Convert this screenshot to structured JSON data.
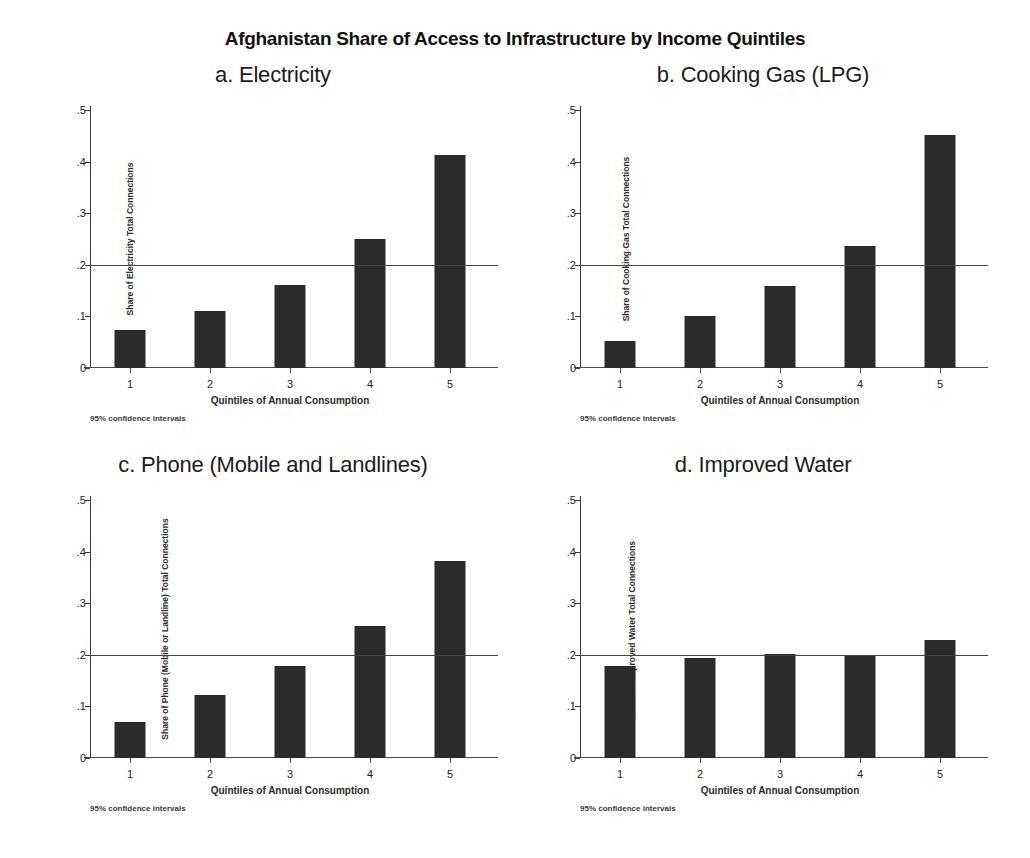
{
  "figure": {
    "title": "Afghanistan Share of Access to Infrastructure by Income Quintiles"
  },
  "chart_data": [
    {
      "type": "bar",
      "panel": "a",
      "title": "a. Electricity",
      "categories": [
        "1",
        "2",
        "3",
        "4",
        "5"
      ],
      "values": [
        0.073,
        0.11,
        0.16,
        0.25,
        0.412
      ],
      "xlabel": "Quintiles of Annual Consumption",
      "ylabel": "Share of Electricity Total Connections",
      "ylim": [
        0,
        0.5
      ],
      "yticks": [
        "0",
        ".1",
        ".2",
        ".3",
        ".4",
        ".5"
      ],
      "ytickvals": [
        0,
        0.1,
        0.2,
        0.3,
        0.4,
        0.5
      ],
      "reference_line": 0.2,
      "grid": false,
      "legend": "none",
      "note": "95% confidence intervals"
    },
    {
      "type": "bar",
      "panel": "b",
      "title": "b. Cooking Gas (LPG)",
      "categories": [
        "1",
        "2",
        "3",
        "4",
        "5"
      ],
      "values": [
        0.052,
        0.1,
        0.158,
        0.237,
        0.452
      ],
      "xlabel": "Quintiles of Annual Consumption",
      "ylabel": "Share of Cooking Gas Total Connections",
      "ylim": [
        0,
        0.5
      ],
      "yticks": [
        "0",
        ".1",
        ".2",
        ".3",
        ".4",
        ".5"
      ],
      "ytickvals": [
        0,
        0.1,
        0.2,
        0.3,
        0.4,
        0.5
      ],
      "reference_line": 0.2,
      "grid": false,
      "legend": "none",
      "note": "95% confidence intervals"
    },
    {
      "type": "bar",
      "panel": "c",
      "title": "c. Phone (Mobile and Landlines)",
      "categories": [
        "1",
        "2",
        "3",
        "4",
        "5"
      ],
      "values": [
        0.069,
        0.122,
        0.178,
        0.255,
        0.381
      ],
      "xlabel": "Quintiles of Annual Consumption",
      "ylabel": "Share of Phone (Mobile or Landline) Total Connections",
      "ylim": [
        0,
        0.5
      ],
      "yticks": [
        "0",
        ".1",
        ".2",
        ".3",
        ".4",
        ".5"
      ],
      "ytickvals": [
        0,
        0.1,
        0.2,
        0.3,
        0.4,
        0.5
      ],
      "reference_line": 0.2,
      "grid": false,
      "legend": "none",
      "note": "95% confidence intervals"
    },
    {
      "type": "bar",
      "panel": "d",
      "title": "d. Improved Water",
      "categories": [
        "1",
        "2",
        "3",
        "4",
        "5"
      ],
      "values": [
        0.178,
        0.193,
        0.201,
        0.2,
        0.228
      ],
      "xlabel": "Quintiles of Annual Consumption",
      "ylabel": "Share of Improved Water Total Connections",
      "ylim": [
        0,
        0.5
      ],
      "yticks": [
        "0",
        ".1",
        ".2",
        ".3",
        ".4",
        ".5"
      ],
      "ytickvals": [
        0,
        0.1,
        0.2,
        0.3,
        0.4,
        0.5
      ],
      "reference_line": 0.2,
      "grid": false,
      "legend": "none",
      "note": "95% confidence intervals"
    }
  ],
  "style": {
    "bar_color": "#2b2b2b",
    "axis_color": "#3a3a3a",
    "background": "#ffffff"
  }
}
